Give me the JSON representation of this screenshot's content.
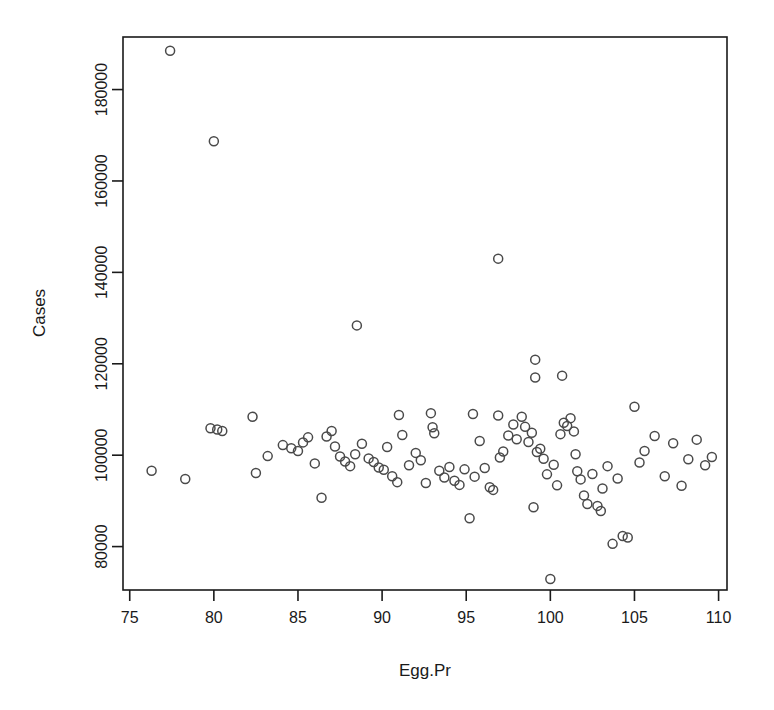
{
  "chart_data": {
    "type": "scatter",
    "title": "",
    "xlabel": "Egg.Pr",
    "ylabel": "Cases",
    "xlim": [
      74.6,
      110.5
    ],
    "ylim": [
      70500,
      191500
    ],
    "xticks": [
      75,
      80,
      85,
      90,
      95,
      100,
      105,
      110
    ],
    "xtick_labels": [
      "75",
      "80",
      "85",
      "90",
      "95",
      "100",
      "105",
      "110"
    ],
    "yticks": [
      80000,
      100000,
      120000,
      140000,
      160000,
      180000
    ],
    "ytick_labels": [
      "80000",
      "100000",
      "120000",
      "140000",
      "160000",
      "180000"
    ],
    "grid": false,
    "legend": null,
    "marker": "open-circle",
    "marker_color": "#4a4a4a",
    "marker_size": 9,
    "box_frame": true,
    "x": [
      77.4,
      80.0,
      96.9,
      88.5,
      99.1,
      99.1,
      100.7,
      76.3,
      78.3,
      79.8,
      80.2,
      80.5,
      82.3,
      82.5,
      83.2,
      84.1,
      84.6,
      85.0,
      85.3,
      85.6,
      86.0,
      86.4,
      86.7,
      87.0,
      87.2,
      87.5,
      87.8,
      88.1,
      88.4,
      88.8,
      89.2,
      89.5,
      89.8,
      90.1,
      90.3,
      90.6,
      90.9,
      91.2,
      91.6,
      92.0,
      92.3,
      92.6,
      92.9,
      93.1,
      93.4,
      93.7,
      94.0,
      94.3,
      94.6,
      94.9,
      95.2,
      95.5,
      95.8,
      96.1,
      96.4,
      96.6,
      96.9,
      97.2,
      97.5,
      97.8,
      98.0,
      98.3,
      98.5,
      98.7,
      98.9,
      99.2,
      99.4,
      99.6,
      99.8,
      100.0,
      100.2,
      100.4,
      100.6,
      100.8,
      101.0,
      101.2,
      101.4,
      101.6,
      101.8,
      102.0,
      102.2,
      102.5,
      102.8,
      103.1,
      103.4,
      103.7,
      104.0,
      104.3,
      104.6,
      105.0,
      105.3,
      105.6,
      106.2,
      106.8,
      107.3,
      107.8,
      108.2,
      108.7,
      109.2,
      109.6,
      91.0,
      93.0,
      95.4,
      97.0,
      99.0,
      101.5,
      103.0
    ],
    "y": [
      188500,
      168700,
      143000,
      128400,
      120900,
      117000,
      117400,
      96600,
      94800,
      105900,
      105600,
      105300,
      108400,
      96100,
      99800,
      102200,
      101500,
      100900,
      102800,
      103900,
      98200,
      90700,
      104100,
      105300,
      101900,
      99700,
      98600,
      97600,
      100200,
      102500,
      99300,
      98500,
      97300,
      96800,
      101800,
      95400,
      94100,
      104400,
      97800,
      100500,
      98900,
      93900,
      109200,
      104800,
      96600,
      95100,
      97400,
      94400,
      93500,
      96900,
      86200,
      95300,
      103100,
      97200,
      93000,
      92400,
      108700,
      100800,
      104300,
      106700,
      103500,
      108400,
      106200,
      102900,
      104900,
      100700,
      101400,
      99200,
      95800,
      72900,
      97900,
      93400,
      104600,
      107100,
      106400,
      108100,
      105200,
      96500,
      94700,
      91200,
      89300,
      95900,
      88900,
      92700,
      97600,
      80600,
      94900,
      82300,
      82000,
      110600,
      98400,
      100900,
      104200,
      95400,
      102600,
      93300,
      99100,
      103400,
      97800,
      99600,
      108800,
      106100,
      109000,
      99500,
      88600,
      100200,
      87800
    ]
  },
  "axis": {
    "x_title": "Egg.Pr",
    "y_title": "Cases"
  }
}
